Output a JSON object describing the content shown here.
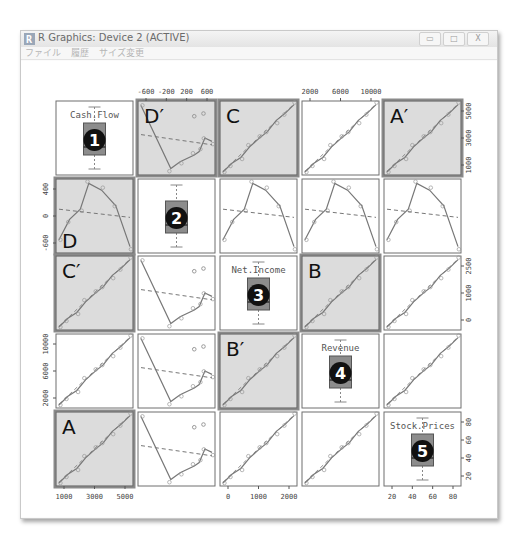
{
  "window": {
    "title": "R Graphics: Device 2 (ACTIVE)",
    "controls": {
      "minimize": "▭",
      "maximize": "□",
      "close": "X"
    },
    "menu": [
      "ファイル",
      "履歴",
      "サイズ変更"
    ]
  },
  "colors": {
    "panel_border": "#6f6f6f",
    "highlight_border": "#8a8a8a",
    "highlight_fill": "#dcdcdc",
    "line": "#777777",
    "box_fill": "#8c8c8c",
    "badge_fill": "#111111"
  },
  "chart_data": {
    "type": "scatter",
    "title": "",
    "variables": [
      "Cash.Flow",
      "Profit",
      "Net.Income",
      "Revenue",
      "Stock.Prices"
    ],
    "layout": "5x5 scatterplot matrix (pairs) with smoothers; boxplots on diagonal",
    "diagonal_labels": [
      "Cash.Flow",
      "",
      "Net.Income",
      "Revenue",
      "Stock.Prices"
    ],
    "diagonal_badges": [
      "1",
      "2",
      "3",
      "4",
      "5"
    ],
    "panel_letters": [
      {
        "row": 0,
        "col": 1,
        "label": "D′"
      },
      {
        "row": 0,
        "col": 2,
        "label": "C"
      },
      {
        "row": 0,
        "col": 4,
        "label": "A′"
      },
      {
        "row": 1,
        "col": 0,
        "label": "D"
      },
      {
        "row": 2,
        "col": 0,
        "label": "C′"
      },
      {
        "row": 2,
        "col": 3,
        "label": "B"
      },
      {
        "row": 3,
        "col": 2,
        "label": "B′"
      },
      {
        "row": 4,
        "col": 0,
        "label": "A"
      }
    ],
    "axes": {
      "top": [
        {
          "col": 1,
          "ticks": [
            "-600",
            "-200",
            "200",
            "600"
          ]
        },
        {
          "col": 3,
          "ticks": [
            "2000",
            "6000",
            "10000"
          ]
        }
      ],
      "bottom": [
        {
          "col": 0,
          "ticks": [
            "1000",
            "3000",
            "5000"
          ]
        },
        {
          "col": 2,
          "ticks": [
            "0",
            "1000",
            "2000"
          ]
        },
        {
          "col": 4,
          "ticks": [
            "20",
            "40",
            "60",
            "80"
          ]
        }
      ],
      "left": [
        {
          "row": 1,
          "ticks": [
            "-600",
            "0",
            "400"
          ]
        },
        {
          "row": 3,
          "ticks": [
            "2000",
            "6000",
            "10000"
          ]
        }
      ],
      "right": [
        {
          "row": 0,
          "ticks": [
            "1000",
            "3000",
            "5000"
          ]
        },
        {
          "row": 2,
          "ticks": [
            "0",
            "1000",
            "2500"
          ]
        },
        {
          "row": 4,
          "ticks": [
            "20",
            "40",
            "60",
            "80"
          ]
        }
      ]
    },
    "ranges": {
      "Cash.Flow": [
        800,
        5300
      ],
      "Profit": [
        -700,
        650
      ],
      "Net.Income": [
        -200,
        2900
      ],
      "Revenue": [
        900,
        11000
      ],
      "Stock.Prices": [
        15,
        85
      ]
    },
    "grid": false,
    "legend": null
  }
}
